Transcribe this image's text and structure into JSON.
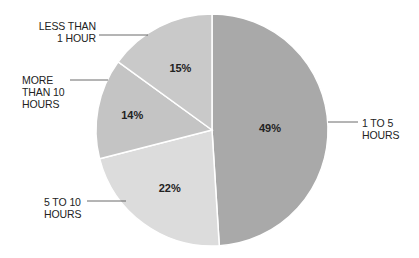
{
  "chart_data": {
    "type": "pie",
    "title": "",
    "start_angle_deg": 0,
    "direction": "clockwise",
    "slices": [
      {
        "label": "1 TO 5 HOURS",
        "value": 49,
        "display": "49%",
        "color": "#a9a9a9"
      },
      {
        "label": "5 TO 10 HOURS",
        "value": 22,
        "display": "22%",
        "color": "#dcdcdc"
      },
      {
        "label": "MORE THAN 10 HOURS",
        "value": 14,
        "display": "14%",
        "color": "#c4c4c4"
      },
      {
        "label": "LESS THAN 1 HOUR",
        "value": 15,
        "display": "15%",
        "color": "#c9c9c9"
      }
    ],
    "legend": "none (callout labels with leader lines)"
  },
  "labels": {
    "one_to_five": [
      "1 TO 5",
      "HOURS"
    ],
    "five_to_ten": [
      "5 TO 10",
      "HOURS"
    ],
    "more_than_ten": [
      "MORE",
      "THAN 10",
      "HOURS"
    ],
    "less_than_one": [
      "LESS THAN",
      "1 HOUR"
    ]
  }
}
